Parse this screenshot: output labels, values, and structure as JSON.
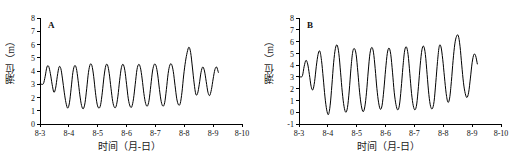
{
  "figure": {
    "background": "#ffffff",
    "line_color": "#000000",
    "axis_color": "#000000"
  },
  "panels": [
    {
      "tag": "A",
      "ylabel": "潮位（m）",
      "xlabel": "时间（月-日）"
    },
    {
      "tag": "B",
      "ylabel": "潮位（m）",
      "xlabel": "时间（月-日）"
    }
  ],
  "chart_data": [
    {
      "type": "line",
      "title": "A",
      "xlabel": "时间（月-日）",
      "ylabel": "潮位（m）",
      "xlim": [
        0,
        7
      ],
      "ylim": [
        0,
        8
      ],
      "xticks": [
        0,
        1,
        2,
        3,
        4,
        5,
        6,
        7
      ],
      "xticklabels": [
        "8-3",
        "8-4",
        "8-5",
        "8-6",
        "8-7",
        "8-8",
        "8-9",
        "8-10"
      ],
      "yticks": [
        0,
        1,
        2,
        3,
        4,
        5,
        6,
        7,
        8
      ],
      "yticklabels": [
        "0",
        "1",
        "2",
        "3",
        "4",
        "5",
        "6",
        "7",
        "8"
      ],
      "grid": false,
      "legend": false,
      "series": [
        {
          "name": "tide-level-A",
          "x": [
            0.0,
            0.06,
            0.12,
            0.18,
            0.24,
            0.3,
            0.36,
            0.42,
            0.48,
            0.54,
            0.6,
            0.66,
            0.72,
            0.78,
            0.84,
            0.9,
            0.96,
            1.02,
            1.08,
            1.14,
            1.2,
            1.26,
            1.32,
            1.38,
            1.44,
            1.5,
            1.56,
            1.62,
            1.68,
            1.74,
            1.8,
            1.86,
            1.92,
            1.98,
            2.04,
            2.1,
            2.16,
            2.22,
            2.28,
            2.34,
            2.4,
            2.46,
            2.52,
            2.58,
            2.64,
            2.7,
            2.76,
            2.82,
            2.88,
            2.94,
            3.0,
            3.06,
            3.12,
            3.18,
            3.24,
            3.3,
            3.36,
            3.42,
            3.48,
            3.54,
            3.6,
            3.66,
            3.72,
            3.78,
            3.84,
            3.9,
            3.96,
            4.02,
            4.08,
            4.14,
            4.2,
            4.26,
            4.32,
            4.38,
            4.44,
            4.5,
            4.56,
            4.62,
            4.68,
            4.74,
            4.8,
            4.86,
            4.92,
            4.98,
            5.04,
            5.1,
            5.16,
            5.22,
            5.28,
            5.34,
            5.4,
            5.46,
            5.52,
            5.58,
            5.64,
            5.7,
            5.76,
            5.82,
            5.88,
            5.94,
            6.0,
            6.06,
            6.12,
            6.18
          ],
          "y": [
            3.0,
            3.0,
            3.05,
            3.6,
            4.3,
            4.35,
            3.8,
            3.0,
            2.4,
            2.7,
            3.6,
            4.3,
            4.2,
            3.4,
            2.4,
            1.6,
            1.2,
            1.6,
            2.7,
            3.9,
            4.4,
            4.2,
            3.3,
            2.2,
            1.4,
            1.15,
            1.6,
            2.7,
            3.9,
            4.5,
            4.4,
            3.6,
            2.4,
            1.5,
            1.2,
            1.45,
            2.4,
            3.6,
            4.4,
            4.45,
            3.8,
            2.7,
            1.7,
            1.25,
            1.35,
            2.1,
            3.3,
            4.25,
            4.5,
            4.05,
            3.0,
            1.9,
            1.35,
            1.3,
            1.9,
            3.0,
            4.1,
            4.5,
            4.25,
            3.4,
            2.3,
            1.55,
            1.35,
            1.8,
            2.9,
            4.0,
            4.5,
            4.4,
            3.7,
            2.6,
            1.7,
            1.35,
            1.6,
            2.6,
            3.8,
            4.45,
            4.5,
            3.95,
            2.9,
            1.9,
            1.45,
            1.55,
            2.4,
            3.7,
            4.7,
            5.4,
            5.8,
            5.4,
            4.3,
            3.1,
            2.25,
            2.3,
            3.0,
            3.9,
            4.3,
            4.0,
            3.2,
            2.4,
            2.15,
            2.6,
            3.4,
            4.1,
            4.3,
            3.9
          ],
          "color": "#000000"
        }
      ],
      "notes": "Semidiurnal tide-level record, roughly two highs and two lows per day; amplitude grows toward a spring-tide maximum of about 5.8 m near 8-7.5, then decreases."
    },
    {
      "type": "line",
      "title": "B",
      "xlabel": "时间（月-日）",
      "ylabel": "潮位（m）",
      "xlim": [
        0,
        7
      ],
      "ylim": [
        -1,
        8
      ],
      "xticks": [
        0,
        1,
        2,
        3,
        4,
        5,
        6,
        7
      ],
      "xticklabels": [
        "8-3",
        "8-4",
        "8-5",
        "8-6",
        "8-7",
        "8-8",
        "8-9",
        "8-10"
      ],
      "yticks": [
        -1,
        0,
        1,
        2,
        3,
        4,
        5,
        6,
        7,
        8
      ],
      "yticklabels": [
        "-1",
        "0",
        "1",
        "2",
        "3",
        "4",
        "5",
        "6",
        "7",
        "8"
      ],
      "grid": false,
      "legend": false,
      "series": [
        {
          "name": "tide-level-B",
          "x": [
            0.0,
            0.06,
            0.12,
            0.18,
            0.24,
            0.3,
            0.36,
            0.42,
            0.48,
            0.54,
            0.6,
            0.66,
            0.72,
            0.78,
            0.84,
            0.9,
            0.96,
            1.02,
            1.08,
            1.14,
            1.2,
            1.26,
            1.32,
            1.38,
            1.44,
            1.5,
            1.56,
            1.62,
            1.68,
            1.74,
            1.8,
            1.86,
            1.92,
            1.98,
            2.04,
            2.1,
            2.16,
            2.22,
            2.28,
            2.34,
            2.4,
            2.46,
            2.52,
            2.58,
            2.64,
            2.7,
            2.76,
            2.82,
            2.88,
            2.94,
            3.0,
            3.06,
            3.12,
            3.18,
            3.24,
            3.3,
            3.36,
            3.42,
            3.48,
            3.54,
            3.6,
            3.66,
            3.72,
            3.78,
            3.84,
            3.9,
            3.96,
            4.02,
            4.08,
            4.14,
            4.2,
            4.26,
            4.32,
            4.38,
            4.44,
            4.5,
            4.56,
            4.62,
            4.68,
            4.74,
            4.8,
            4.86,
            4.92,
            4.98,
            5.04,
            5.1,
            5.16,
            5.22,
            5.28,
            5.34,
            5.4,
            5.46,
            5.52,
            5.58,
            5.64,
            5.7,
            5.76,
            5.82,
            5.88,
            5.94,
            6.0,
            6.06,
            6.12,
            6.18
          ],
          "y": [
            3.0,
            3.0,
            3.1,
            3.9,
            4.4,
            4.1,
            3.2,
            2.2,
            1.9,
            2.6,
            3.9,
            4.9,
            5.2,
            4.4,
            2.9,
            1.3,
            0.2,
            -0.2,
            0.6,
            2.3,
            4.2,
            5.4,
            5.7,
            5.0,
            3.4,
            1.7,
            0.5,
            0.0,
            0.4,
            1.8,
            3.7,
            5.1,
            5.4,
            4.9,
            3.4,
            1.7,
            0.55,
            0.05,
            0.45,
            1.7,
            3.5,
            5.0,
            5.5,
            5.1,
            3.7,
            2.0,
            0.8,
            0.25,
            0.6,
            1.9,
            3.6,
            5.0,
            5.45,
            4.9,
            3.4,
            1.7,
            0.65,
            0.2,
            0.6,
            2.0,
            3.8,
            5.2,
            5.55,
            4.9,
            3.3,
            1.6,
            0.55,
            0.2,
            0.7,
            2.2,
            4.0,
            5.3,
            5.6,
            4.9,
            3.2,
            1.5,
            0.5,
            0.3,
            0.9,
            2.5,
            4.3,
            5.6,
            5.55,
            4.5,
            3.0,
            1.6,
            0.85,
            1.2,
            2.6,
            4.4,
            5.8,
            6.45,
            6.5,
            5.6,
            4.0,
            2.5,
            1.6,
            1.25,
            1.7,
            2.9,
            4.2,
            4.9,
            4.8,
            4.1
          ],
          "color": "#000000"
        }
      ],
      "notes": "Same period as panel A but larger tidal range: lows reach about -0.3 m and the spring-tide high reaches about 6.5 m near 8-7.5."
    }
  ]
}
